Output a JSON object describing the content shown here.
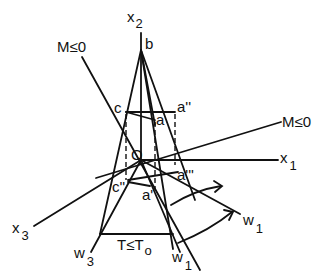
{
  "diagram": {
    "type": "geometric-projection",
    "axes": {
      "x1": {
        "label": "x",
        "subscript": "1"
      },
      "x2": {
        "label": "x",
        "subscript": "2"
      },
      "x3": {
        "label": "x",
        "subscript": "3"
      }
    },
    "constraints": {
      "m_upper": "M≤0",
      "m_right": "M≤0",
      "temperature": "T≤T",
      "temperature_sub": "o"
    },
    "points": {
      "origin": "O",
      "b": "b",
      "c": "c",
      "a": "a",
      "a2": "a''",
      "a3": "a'''",
      "c2": "c''",
      "a1": "a'"
    },
    "vectors": {
      "w1_right": {
        "label": "w",
        "subscript": "1"
      },
      "w1_bottom": {
        "label": "w",
        "subscript": "1"
      },
      "w3": {
        "label": "w",
        "subscript": "3"
      }
    }
  }
}
